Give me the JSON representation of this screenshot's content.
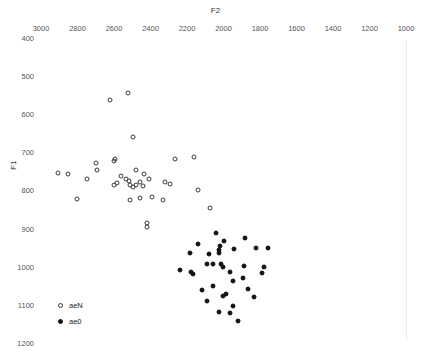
{
  "chart_data": {
    "type": "scatter",
    "title": "",
    "xlabel": "F2",
    "ylabel": "F1",
    "xlim": [
      3100,
      960
    ],
    "ylim": [
      1220,
      390
    ],
    "x_axis_reversed": true,
    "y_axis_reversed": true,
    "grid": false,
    "legend_position": "bottom-left",
    "xticks": [
      3000,
      2800,
      2600,
      2400,
      2200,
      2000,
      1800,
      1600,
      1400,
      1200,
      1000
    ],
    "yticks": [
      400,
      500,
      600,
      700,
      800,
      900,
      1000,
      1100,
      1200
    ],
    "series": [
      {
        "name": "aeN",
        "marker": "open-circle",
        "color": "#3a3a3a",
        "points": [
          [
            2622,
            563
          ],
          [
            2524,
            545
          ],
          [
            2497,
            661
          ],
          [
            2908,
            754
          ],
          [
            2699,
            729
          ],
          [
            2693,
            747
          ],
          [
            2595,
            717
          ],
          [
            2601,
            724
          ],
          [
            2584,
            781
          ],
          [
            2561,
            762
          ],
          [
            2534,
            771
          ],
          [
            2518,
            776
          ],
          [
            2513,
            787
          ],
          [
            2497,
            790
          ],
          [
            2480,
            786
          ],
          [
            2458,
            779
          ],
          [
            2442,
            789
          ],
          [
            2480,
            747
          ],
          [
            2437,
            757
          ],
          [
            2409,
            770
          ],
          [
            2322,
            777
          ],
          [
            2294,
            783
          ],
          [
            2267,
            717
          ],
          [
            2163,
            713
          ],
          [
            2141,
            800
          ],
          [
            2076,
            845
          ],
          [
            2748,
            769
          ],
          [
            2853,
            756
          ],
          [
            2802,
            822
          ],
          [
            2420,
            886
          ],
          [
            2420,
            897
          ],
          [
            2513,
            824
          ],
          [
            2458,
            821
          ],
          [
            2392,
            818
          ],
          [
            2333,
            824
          ],
          [
            2600,
            785
          ]
        ]
      },
      {
        "name": "ae0",
        "marker": "filled-circle",
        "color": "#111111",
        "points": [
          [
            2043,
            913
          ],
          [
            2137,
            940
          ],
          [
            2082,
            967
          ],
          [
            2021,
            946
          ],
          [
            2027,
            957
          ],
          [
            2027,
            963
          ],
          [
            2186,
            965
          ],
          [
            2000,
            932
          ],
          [
            1945,
            953
          ],
          [
            1884,
            924
          ],
          [
            1824,
            952
          ],
          [
            1758,
            950
          ],
          [
            2169,
            1020
          ],
          [
            2005,
            1000
          ],
          [
            2093,
            994
          ],
          [
            2055,
            994
          ],
          [
            2016,
            994
          ],
          [
            1967,
            1013
          ],
          [
            1950,
            1038
          ],
          [
            1895,
            1030
          ],
          [
            1791,
            1018
          ],
          [
            2120,
            1061
          ],
          [
            2060,
            1052
          ],
          [
            2005,
            1076
          ],
          [
            1989,
            1071
          ],
          [
            1950,
            1103
          ],
          [
            2093,
            1090
          ],
          [
            2027,
            1120
          ],
          [
            1967,
            1123
          ],
          [
            1923,
            1143
          ],
          [
            1868,
            1060
          ],
          [
            1835,
            1079
          ],
          [
            1780,
            1000
          ],
          [
            2180,
            1013
          ],
          [
            2240,
            1010
          ],
          [
            1890,
            998
          ]
        ]
      }
    ]
  },
  "axes": {
    "f2_label": "F2",
    "f1_label": "F1"
  },
  "legend": {
    "items": [
      {
        "label": "aeN",
        "marker": "open-circle"
      },
      {
        "label": "ae0",
        "marker": "filled-circle"
      }
    ]
  }
}
